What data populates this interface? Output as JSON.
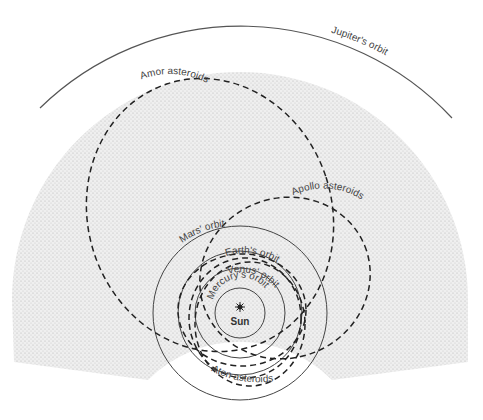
{
  "diagram": {
    "center_label": "Sun",
    "orbits": [
      {
        "name": "Mercury",
        "label": "Mercury's orbit"
      },
      {
        "name": "Venus",
        "label": "Venus' orbit"
      },
      {
        "name": "Earth",
        "label": "Earth's orbit"
      },
      {
        "name": "Mars",
        "label": "Mars' orbit"
      },
      {
        "name": "Jupiter",
        "label": "Jupiter's orbit"
      }
    ],
    "asteroid_groups": [
      {
        "name": "Amor",
        "label": "Amor asteroids"
      },
      {
        "name": "Apollo",
        "label": "Apollo asteroids"
      },
      {
        "name": "Aten",
        "label": "Aten asteroids"
      }
    ],
    "colors": {
      "line": "#333333",
      "belt_fill": "#e6e6e6",
      "background": "#ffffff"
    }
  }
}
